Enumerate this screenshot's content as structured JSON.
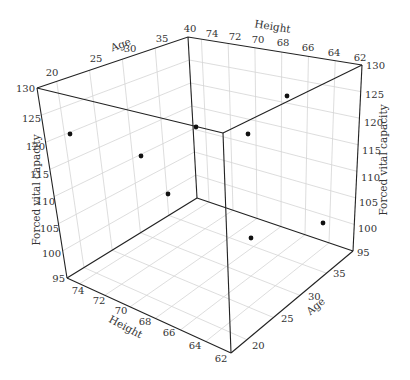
{
  "chart_data": {
    "type": "scatter3d",
    "title": "",
    "axes": {
      "x": {
        "label": "Height",
        "ticks": [
          74,
          72,
          70,
          68,
          66,
          64,
          62
        ],
        "range": [
          62,
          75
        ]
      },
      "y": {
        "label": "Age",
        "ticks": [
          20,
          25,
          30,
          35,
          40
        ],
        "range": [
          17,
          40
        ]
      },
      "z": {
        "label": "Forced vital capacity",
        "ticks": [
          95,
          100,
          105,
          110,
          115,
          120,
          125,
          130
        ],
        "range": [
          95,
          130
        ]
      }
    },
    "grid": true,
    "legend": null,
    "points": [
      {
        "screen": [
          70,
          134
        ]
      },
      {
        "screen": [
          141,
          156
        ]
      },
      {
        "screen": [
          196,
          127
        ]
      },
      {
        "screen": [
          168,
          194
        ]
      },
      {
        "screen": [
          248,
          134
        ]
      },
      {
        "screen": [
          287,
          96
        ]
      },
      {
        "screen": [
          251,
          238
        ]
      },
      {
        "screen": [
          323,
          223
        ]
      }
    ],
    "point_count": 8
  },
  "labels": {
    "age_top": "Age",
    "height_top": "Height",
    "height_bottom": "Height",
    "age_bottom": "Age",
    "fvc_left": "Forced vital capacity",
    "fvc_right": "Forced vital capacity"
  },
  "ticks": {
    "age_top": [
      "20",
      "25",
      "30",
      "35",
      "40"
    ],
    "height_top": [
      "74",
      "72",
      "70",
      "68",
      "66",
      "64",
      "62"
    ],
    "fvc_left": [
      "130",
      "125",
      "120",
      "115",
      "110",
      "105",
      "100",
      "95"
    ],
    "fvc_right": [
      "130",
      "125",
      "120",
      "115",
      "110",
      "105",
      "100",
      "95"
    ],
    "height_bottom": [
      "74",
      "72",
      "70",
      "68",
      "66",
      "64",
      "62"
    ],
    "age_bottom": [
      "20",
      "25",
      "30",
      "35"
    ]
  }
}
